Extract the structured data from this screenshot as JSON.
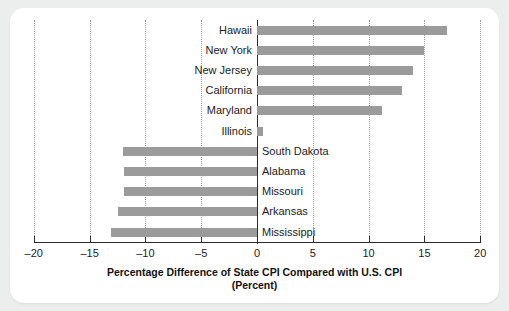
{
  "chart_data": {
    "type": "bar",
    "orientation": "horizontal",
    "title": "Percentage Difference of State CPI Compared with U.S. CPI",
    "subtitle": "(Percent)",
    "xlabel": "",
    "ylabel": "",
    "xlim": [
      -20,
      20
    ],
    "xticks": [
      -20,
      -15,
      -10,
      -5,
      0,
      5,
      10,
      15,
      20
    ],
    "xticklabels": [
      "–20",
      "–15",
      "–10",
      "–5",
      "0",
      "5",
      "10",
      "15",
      "20"
    ],
    "grid": "vertical-dotted",
    "legend": "none",
    "bar_color": "#9b9b9b",
    "categories": [
      "Hawaii",
      "New York",
      "New Jersey",
      "California",
      "Maryland",
      "Illinois",
      "South Dakota",
      "Alabama",
      "Missouri",
      "Arkansas",
      "Mississippi"
    ],
    "values": [
      17.0,
      15.0,
      14.0,
      13.0,
      11.2,
      0.5,
      -12.0,
      -11.9,
      -11.9,
      -12.5,
      -13.1
    ]
  },
  "chart": {
    "title": "Percentage Difference of State CPI Compared with U.S. CPI",
    "subtitle": "(Percent)"
  }
}
